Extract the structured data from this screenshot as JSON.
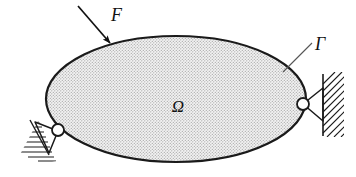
{
  "figure": {
    "background_color": "#ffffff",
    "outline_color": "#1a1a1a",
    "fill_color": "#e8e8e8",
    "stipple_dot_color": "#a9a9a9",
    "width": 356,
    "height": 177
  },
  "labels": {
    "force": "F",
    "boundary": "Γ",
    "domain": "Ω"
  },
  "annotations": {
    "force_arrow": {
      "name": "force-arrow",
      "from_x": 78,
      "from_y": 6,
      "to_x": 113,
      "to_y": 46,
      "label": "F",
      "label_x": 111,
      "label_y": 21
    },
    "boundary_leader": {
      "name": "boundary-leader-line",
      "from_x": 313,
      "from_y": 42,
      "to_x": 283,
      "to_y": 72,
      "label": "Γ",
      "label_x": 316,
      "label_y": 50
    },
    "domain_label": {
      "name": "domain-label",
      "label": "Ω",
      "label_x": 178,
      "label_y": 112
    }
  },
  "body": {
    "shape": "ellipse",
    "center_x": 176,
    "center_y": 99,
    "radius_x": 130,
    "radius_y": 63
  },
  "supports": [
    {
      "name": "pin-support-left",
      "type": "pin",
      "pin_x": 58,
      "pin_y": 131,
      "pin_radius": 6,
      "orientation": "lower-left-inclined"
    },
    {
      "name": "pin-support-right",
      "type": "pin",
      "pin_x": 303,
      "pin_y": 104,
      "pin_radius": 6,
      "orientation": "right-vertical-wall"
    }
  ]
}
